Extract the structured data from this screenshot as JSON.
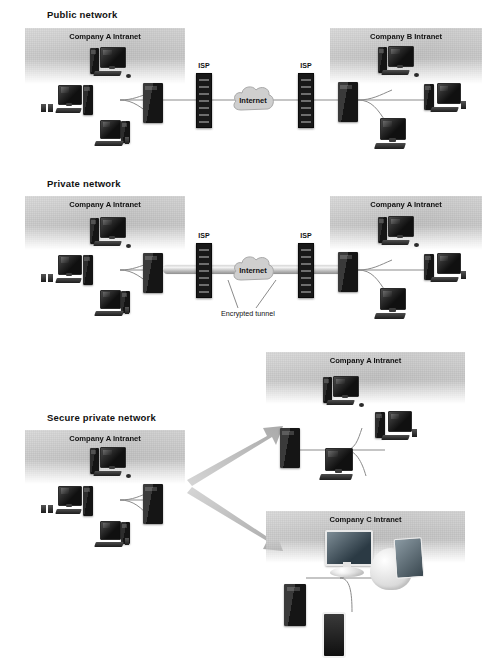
{
  "figure": {
    "type": "diagram",
    "palette": {
      "panel_gray": "#c8c8c8",
      "device_black": "#161616",
      "wire_gray": "#8d8d8d",
      "arrow_gray": "#b9b9b9",
      "background": "#ffffff"
    }
  },
  "sections": [
    {
      "id": "public",
      "title": "Public network",
      "panels": [
        {
          "label": "Company A Intranet"
        },
        {
          "label": "Company B Intranet"
        }
      ],
      "isp_labels": [
        "ISP",
        "ISP"
      ],
      "cloud_label": "Internet"
    },
    {
      "id": "private",
      "title": "Private network",
      "panels": [
        {
          "label": "Company A Intranet"
        },
        {
          "label": "Company A Intranet"
        }
      ],
      "isp_labels": [
        "ISP",
        "ISP"
      ],
      "cloud_label": "Internet",
      "annotation": "Encrypted tunnel"
    },
    {
      "id": "secure-private",
      "title": "Secure private network",
      "panels": [
        {
          "label": "Company A Intranet"
        },
        {
          "label": "Company A Intranet"
        },
        {
          "label": "Company C Intranet"
        }
      ]
    }
  ],
  "labels": {
    "public_title": "Public network",
    "private_title": "Private network",
    "secure_title": "Secure private network",
    "company_a": "Company A Intranet",
    "company_b": "Company B Intranet",
    "company_c": "Company C Intranet",
    "isp": "ISP",
    "internet": "Internet",
    "encrypted_tunnel": "Encrypted tunnel"
  }
}
